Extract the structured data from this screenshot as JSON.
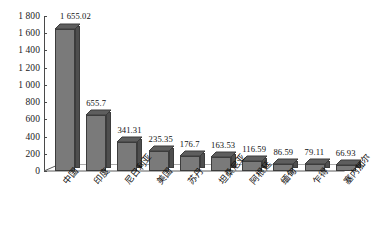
{
  "chart_data": {
    "type": "bar",
    "title": "",
    "xlabel": "",
    "ylabel": "",
    "ylim": [
      0,
      1800
    ],
    "ytick_step": 200,
    "grid": false,
    "legend": "none",
    "style": "3d-column",
    "categories": [
      "中国",
      "印度",
      "尼日利亚",
      "美国",
      "苏丹",
      "坦桑尼亚",
      "阿根廷",
      "缅甸",
      "乍得",
      "塞内加尔"
    ],
    "values": [
      1655.02,
      655.7,
      341.31,
      235.35,
      176.7,
      163.53,
      116.59,
      86.59,
      79.11,
      66.93
    ],
    "value_labels": [
      "1 655.02",
      "655.7",
      "341.31",
      "235.35",
      "176.7",
      "163.53",
      "116.59",
      "86.59",
      "79.11",
      "66.93"
    ],
    "ytick_labels": [
      "1 800",
      "1 600",
      "1 400",
      "1 200",
      "1 000",
      "800",
      "600",
      "400",
      "200",
      "0"
    ],
    "ytick_values": [
      1800,
      1600,
      1400,
      1200,
      1000,
      800,
      600,
      400,
      200,
      0
    ],
    "colors": {
      "bar_face": "#7a7a7a",
      "bar_side": "#4e4e4e",
      "bar_top": "#5e5e5e",
      "bar_outline": "#3c3c3c",
      "axis": "#4a4a4a",
      "text": "#111111",
      "background": "#ffffff"
    }
  },
  "caption": ""
}
